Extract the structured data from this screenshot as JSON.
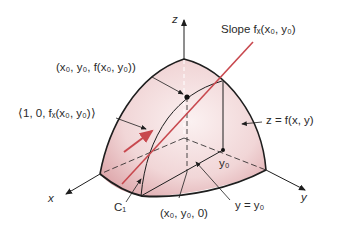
{
  "figure": {
    "colors": {
      "surface_fill_light": "#f7e6e6",
      "surface_fill_dark": "#d9a0a4",
      "tangent_line": "#c8484e",
      "outline": "#1e1e1e",
      "text": "#2a2a2a"
    }
  },
  "labels": {
    "z_axis": "z",
    "x_axis": "x",
    "y_axis": "y",
    "slope": "Slope fₓ(x₀, y₀)",
    "point": "(x₀, y₀, f(x₀, y₀))",
    "tangent_vector": "⟨1, 0, fₓ(x₀, y₀)⟩",
    "surface": "z = f(x, y)",
    "y0": "y₀",
    "curve": "C₁",
    "base_point": "(x₀, y₀, 0)",
    "plane": "y = y₀"
  }
}
